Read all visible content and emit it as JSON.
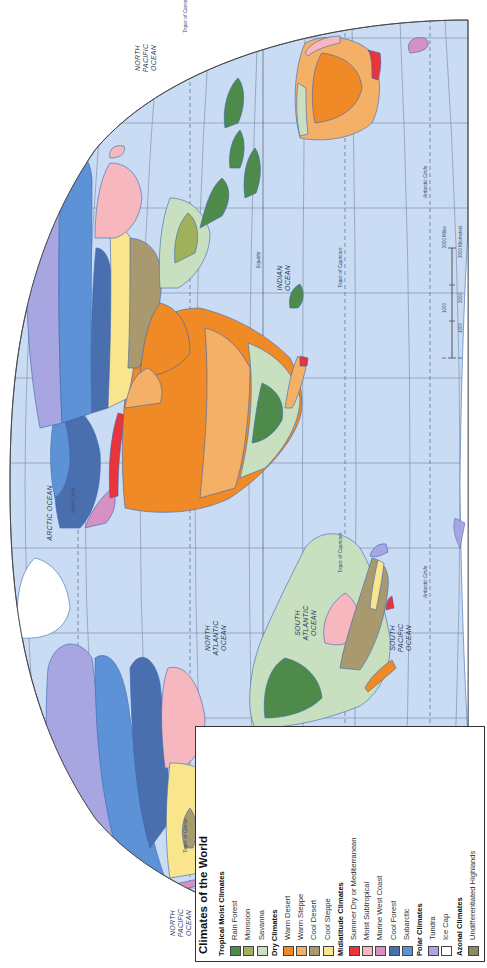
{
  "legend": {
    "title": "Climates of the World",
    "groups": [
      {
        "heading": "Tropical Moist Climates",
        "items": [
          {
            "label": "Rain Forest",
            "color": "#4e8a4a"
          },
          {
            "label": "Monsoon",
            "color": "#9fb25a"
          },
          {
            "label": "Savanna",
            "color": "#c8dfc0"
          }
        ]
      },
      {
        "heading": "Dry Climates",
        "items": [
          {
            "label": "Warm Desert",
            "color": "#f08a26"
          },
          {
            "label": "Warm Steppe",
            "color": "#f4b066"
          },
          {
            "label": "Cool Desert",
            "color": "#a89a6e"
          },
          {
            "label": "Cool Steppe",
            "color": "#f8e58c"
          }
        ]
      },
      {
        "heading": "Midlatitude Climates",
        "items": [
          {
            "label": "Summer Dry or Mediterranean",
            "color": "#e8343a"
          },
          {
            "label": "Moist Subtropical",
            "color": "#f6b8be"
          },
          {
            "label": "Marine West Coast",
            "color": "#d690c4"
          },
          {
            "label": "Cool Forest",
            "color": "#4a6fae"
          },
          {
            "label": "Subarctic",
            "color": "#5e92d6"
          }
        ]
      },
      {
        "heading": "Polar Climates",
        "items": [
          {
            "label": "Tundra",
            "color": "#a8a6e0"
          },
          {
            "label": "Ice Cap",
            "color": "#ffffff"
          }
        ]
      },
      {
        "heading": "Azonal Climates",
        "items": [
          {
            "label": "Undifferentiated Highlands",
            "color": "#8a8a5a"
          }
        ]
      }
    ]
  },
  "map": {
    "ocean_color": "#c9dcf3",
    "land_outline_color": "#3a66b4",
    "graticule_color": "#5a6a88",
    "oceans": [
      {
        "label": "NORTH PACIFIC OCEAN",
        "where": "west"
      },
      {
        "label": "NORTH ATLANTIC OCEAN"
      },
      {
        "label": "SOUTH ATLANTIC OCEAN"
      },
      {
        "label": "SOUTH PACIFIC OCEAN"
      },
      {
        "label": "ARCTIC OCEAN"
      },
      {
        "label": "INDIAN OCEAN"
      },
      {
        "label": "NORTH PACIFIC OCEAN",
        "where": "east"
      }
    ],
    "lines": {
      "equator": "Equator",
      "tropic_cancer": "Tropic of Cancer",
      "tropic_capricorn": "Tropic of Capricorn",
      "arctic_circle": "Arctic Circle",
      "antarctic_circle": "Antarctic Circle"
    },
    "scale": {
      "miles": [
        "0",
        "1000",
        "2000 Miles"
      ],
      "km": [
        "0",
        "1000",
        "2000",
        "3000 Kilometers"
      ]
    }
  }
}
